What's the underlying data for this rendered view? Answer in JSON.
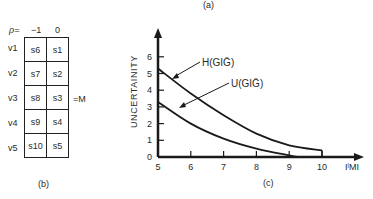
{
  "figure": {
    "caption_a": "(a)",
    "caption_b": "(b)",
    "caption_c": "(c)"
  },
  "matrix": {
    "header_label": "ρ=",
    "columns": [
      "−1",
      "0"
    ],
    "rows": [
      {
        "label": "v1",
        "cells": [
          "s6",
          "s1"
        ]
      },
      {
        "label": "v2",
        "cells": [
          "s7",
          "s2"
        ]
      },
      {
        "label": "v3",
        "cells": [
          "s8",
          "s3"
        ]
      },
      {
        "label": "v4",
        "cells": [
          "s9",
          "s4"
        ]
      },
      {
        "label": "v5",
        "cells": [
          "s10",
          "s5"
        ]
      }
    ],
    "equals_label": "=M"
  },
  "chart_data": {
    "type": "line",
    "title": "",
    "xlabel": "IˡMI",
    "ylabel": "UNCERTAINITY",
    "xlim": [
      5,
      10
    ],
    "ylim": [
      0,
      6
    ],
    "x_ticks": [
      "5",
      "6",
      "7",
      "8",
      "9",
      "10"
    ],
    "y_ticks": [
      "0",
      "1",
      "2",
      "3",
      "4",
      "5",
      "6"
    ],
    "grid": false,
    "series": [
      {
        "name": "H(GIḠ)",
        "x": [
          5,
          6,
          7,
          8,
          9,
          10
        ],
        "values": [
          5.3,
          3.8,
          2.5,
          1.4,
          0.7,
          0.4
        ]
      },
      {
        "name": "U(GIḠ)",
        "x": [
          5,
          6,
          7,
          8,
          9,
          9.3
        ],
        "values": [
          3.3,
          2.0,
          1.1,
          0.5,
          0.1,
          0.0
        ]
      }
    ],
    "annotations": [
      "H(GIḠ)",
      "U(GIḠ)"
    ]
  }
}
